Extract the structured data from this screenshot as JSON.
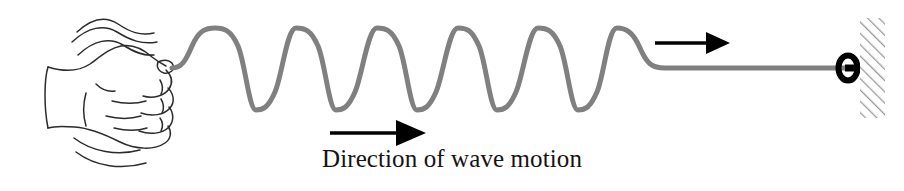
{
  "figure": {
    "caption": "Direction of wave motion",
    "background_color": "#ffffff"
  },
  "rope": {
    "name": "rope-wave",
    "color": "#808080",
    "stroke_width": 5,
    "start_x": 172,
    "start_y": 68,
    "axis_y": 68,
    "peak_y": 28,
    "trough_y": 110,
    "amplitude": 41,
    "wavelength": 80,
    "peak_positions": [
      215,
      296,
      377,
      458,
      538,
      617
    ],
    "wave_start_x": 178,
    "wave_end_x": 660,
    "flat_start_x": 665,
    "flat_end_x": 845,
    "cycles": 6
  },
  "hand": {
    "name": "hand-fist",
    "line_color": "#2b2b2b",
    "stroke_width": 1.4,
    "motion_lines_above": 3,
    "motion_lines_below": 2,
    "description": "closed fist gripping the end of the rope"
  },
  "arrows": {
    "wave_motion": {
      "name": "arrow-wave-motion",
      "label": "Direction of wave motion",
      "color": "#000000",
      "x_start": 330,
      "x_end": 425,
      "y": 133,
      "direction": "right"
    },
    "upper": {
      "name": "arrow-upper-direction",
      "label": "",
      "color": "#000000",
      "x_start": 655,
      "x_end": 727,
      "y": 43,
      "direction": "right"
    }
  },
  "anchor": {
    "ring": {
      "name": "anchor-ring",
      "color": "#000000",
      "cx": 848,
      "cy": 68,
      "rx": 9,
      "ry": 12
    },
    "wall": {
      "name": "wall-hatched",
      "hatch_color": "#999999",
      "x": 860,
      "y": 18,
      "width": 25,
      "height": 100,
      "hatch_direction": "forward-slash"
    }
  },
  "caption": {
    "text": "Direction of wave motion",
    "color": "#141414",
    "font_size_px": 25
  }
}
